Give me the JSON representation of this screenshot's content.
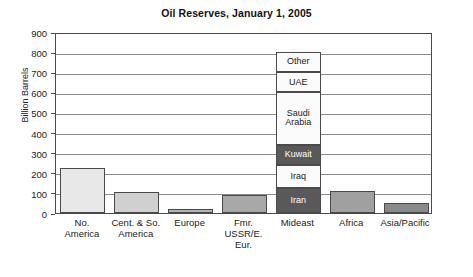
{
  "chart_data": {
    "type": "bar",
    "title": "Oil Reserves, January 1, 2005",
    "xlabel": "",
    "ylabel": "Billion Barrels",
    "ylim": [
      0,
      900
    ],
    "ytick_step": 100,
    "yticks": [
      "900",
      "800",
      "700",
      "600",
      "500",
      "400",
      "300",
      "200",
      "100",
      "0"
    ],
    "grid": true,
    "legend": "none",
    "categories": [
      "No. America",
      "Cent. & So. America",
      "Europe",
      "Fmr. USSR/E. Eur.",
      "Mideast",
      "Africa",
      "Asia/Pacific"
    ],
    "values": [
      225,
      103,
      22,
      90,
      800,
      110,
      50
    ],
    "stacked_category": "Mideast",
    "stack_segments": [
      {
        "label": "Iran",
        "value": 125,
        "color": "#595959",
        "text_color": "#ffffff"
      },
      {
        "label": "Iraq",
        "value": 115,
        "color": "#fbfbfb",
        "text_color": "#1a1a1a"
      },
      {
        "label": "Kuwait",
        "value": 100,
        "color": "#595959",
        "text_color": "#ffffff"
      },
      {
        "label": "Saudi Arabia",
        "value": 260,
        "color": "#fbfbfb",
        "text_color": "#1a1a1a"
      },
      {
        "label": "UAE",
        "value": 100,
        "color": "#fbfbfb",
        "text_color": "#1a1a1a"
      },
      {
        "label": "Other",
        "value": 100,
        "color": "#fbfbfb",
        "text_color": "#1a1a1a"
      }
    ],
    "bar_colors": [
      "#e8e8e8",
      "#d0d0d0",
      "#b4b4b4",
      "#a8a8a8",
      "#595959",
      "#a0a0a0",
      "#8a8a8a"
    ]
  },
  "labels": {
    "cat_lines": [
      [
        "No.",
        "America"
      ],
      [
        "Cent. & So.",
        "America"
      ],
      [
        "Europe"
      ],
      [
        "Fmr.",
        "USSR/E.",
        "Eur."
      ],
      [
        "Mideast"
      ],
      [
        "Africa"
      ],
      [
        "Asia/Pacific"
      ]
    ]
  },
  "colors": {
    "axis": "#4a4a4a",
    "grid": "#8c8c8c",
    "background": "#ffffff",
    "text": "#1a1a1a"
  }
}
